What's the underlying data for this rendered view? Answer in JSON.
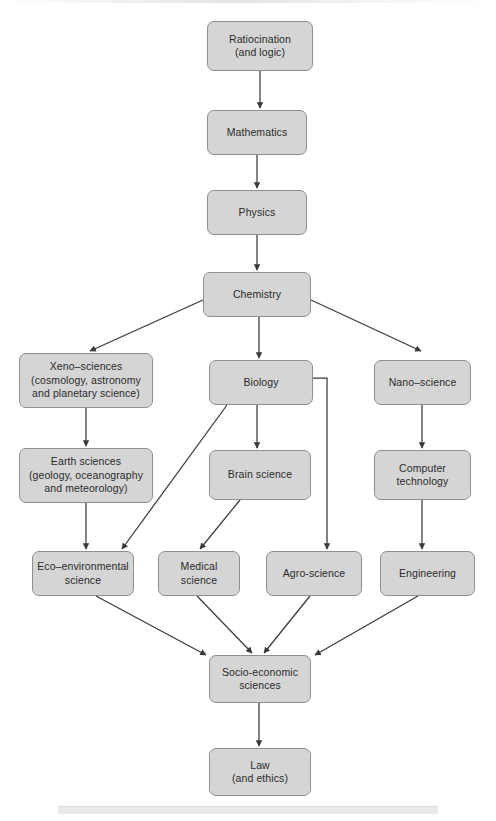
{
  "diagram": {
    "type": "flowchart",
    "style": {
      "node_fill": "#d5d5d5",
      "node_border": "#8f8f8f",
      "text_color": "#2b2b2b",
      "edge_color": "#3a3a3a",
      "background": "#ffffff"
    },
    "nodes": [
      {
        "id": "ratiocination",
        "lines": [
          "Ratiocination",
          "(and logic)"
        ],
        "x": 207,
        "y": 21,
        "w": 106,
        "h": 50
      },
      {
        "id": "mathematics",
        "lines": [
          "Mathematics"
        ],
        "x": 207,
        "y": 110,
        "w": 100,
        "h": 45
      },
      {
        "id": "physics",
        "lines": [
          "Physics"
        ],
        "x": 207,
        "y": 190,
        "w": 100,
        "h": 45
      },
      {
        "id": "chemistry",
        "lines": [
          "Chemistry"
        ],
        "x": 203,
        "y": 272,
        "w": 108,
        "h": 45
      },
      {
        "id": "xeno",
        "lines": [
          "Xeno–sciences",
          "(cosmology, astronomy",
          "and planetary science)"
        ],
        "x": 19,
        "y": 353,
        "w": 134,
        "h": 55
      },
      {
        "id": "biology",
        "lines": [
          "Biology"
        ],
        "x": 209,
        "y": 360,
        "w": 104,
        "h": 45
      },
      {
        "id": "nano",
        "lines": [
          "Nano–science"
        ],
        "x": 374,
        "y": 360,
        "w": 97,
        "h": 45
      },
      {
        "id": "earth",
        "lines": [
          "Earth sciences",
          "(geology, oceanography",
          "and meteorology)"
        ],
        "x": 19,
        "y": 448,
        "w": 134,
        "h": 55
      },
      {
        "id": "brain",
        "lines": [
          "Brain science"
        ],
        "x": 209,
        "y": 450,
        "w": 102,
        "h": 50
      },
      {
        "id": "computer",
        "lines": [
          "Computer",
          "technology"
        ],
        "x": 374,
        "y": 450,
        "w": 97,
        "h": 50
      },
      {
        "id": "eco",
        "lines": [
          "Eco–environmental",
          "science"
        ],
        "x": 32,
        "y": 551,
        "w": 102,
        "h": 45
      },
      {
        "id": "medical",
        "lines": [
          "Medical",
          "science"
        ],
        "x": 158,
        "y": 551,
        "w": 82,
        "h": 45
      },
      {
        "id": "agro",
        "lines": [
          "Agro-science"
        ],
        "x": 266,
        "y": 551,
        "w": 96,
        "h": 45
      },
      {
        "id": "engineering",
        "lines": [
          "Engineering"
        ],
        "x": 380,
        "y": 551,
        "w": 95,
        "h": 45
      },
      {
        "id": "socio",
        "lines": [
          "Socio-economic",
          "sciences"
        ],
        "x": 209,
        "y": 655,
        "w": 102,
        "h": 48
      },
      {
        "id": "law",
        "lines": [
          "Law",
          "(and ethics)"
        ],
        "x": 209,
        "y": 748,
        "w": 102,
        "h": 48
      }
    ],
    "edges": [
      {
        "from": "ratiocination",
        "to": "mathematics",
        "kind": "straight"
      },
      {
        "from": "mathematics",
        "to": "physics",
        "kind": "straight"
      },
      {
        "from": "physics",
        "to": "chemistry",
        "kind": "straight"
      },
      {
        "from": "chemistry",
        "to": "xeno",
        "kind": "diagonal"
      },
      {
        "from": "chemistry",
        "to": "biology",
        "kind": "straight"
      },
      {
        "from": "chemistry",
        "to": "nano",
        "kind": "diagonal"
      },
      {
        "from": "xeno",
        "to": "earth",
        "kind": "straight"
      },
      {
        "from": "earth",
        "to": "eco",
        "kind": "straight"
      },
      {
        "from": "biology",
        "to": "brain",
        "kind": "straight"
      },
      {
        "from": "biology",
        "to": "eco",
        "kind": "diagonal"
      },
      {
        "from": "biology",
        "to": "agro",
        "kind": "elbow"
      },
      {
        "from": "brain",
        "to": "medical",
        "kind": "diagonal"
      },
      {
        "from": "nano",
        "to": "computer",
        "kind": "straight"
      },
      {
        "from": "computer",
        "to": "engineering",
        "kind": "straight"
      },
      {
        "from": "eco",
        "to": "socio",
        "kind": "diagonal"
      },
      {
        "from": "medical",
        "to": "socio",
        "kind": "diagonal"
      },
      {
        "from": "agro",
        "to": "socio",
        "kind": "diagonal"
      },
      {
        "from": "engineering",
        "to": "socio",
        "kind": "diagonal"
      },
      {
        "from": "socio",
        "to": "law",
        "kind": "straight"
      }
    ]
  }
}
